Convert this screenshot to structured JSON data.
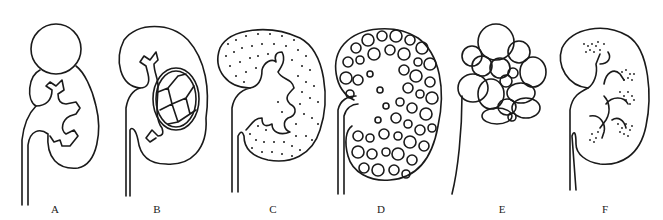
{
  "figure": {
    "panels": [
      {
        "id": "A",
        "label": "A",
        "x": 55
      },
      {
        "id": "B",
        "label": "B",
        "x": 157
      },
      {
        "id": "C",
        "label": "C",
        "x": 273
      },
      {
        "id": "D",
        "label": "D",
        "x": 381
      },
      {
        "id": "E",
        "label": "E",
        "x": 502
      },
      {
        "id": "F",
        "label": "F",
        "x": 605
      }
    ]
  }
}
